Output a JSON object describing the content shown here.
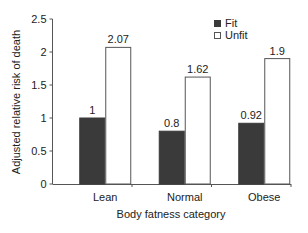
{
  "chart_data": {
    "type": "bar",
    "title": "",
    "xlabel": "Body fatness category",
    "ylabel": "Adjusted relative risk of death",
    "categories": [
      "Lean",
      "Normal",
      "Obese"
    ],
    "series": [
      {
        "name": "Fit",
        "values": [
          1,
          0.8,
          0.92
        ],
        "labels": [
          "1",
          "0.8",
          "0.92"
        ],
        "color": "#3a3a3a"
      },
      {
        "name": "Unfit",
        "values": [
          2.07,
          1.62,
          1.9
        ],
        "labels": [
          "2.07",
          "1.62",
          "1.9"
        ],
        "color": "#ffffff"
      }
    ],
    "ylim": [
      0,
      2.5
    ],
    "yticks": [
      0,
      0.5,
      1,
      1.5,
      2,
      2.5
    ],
    "ytick_labels": [
      "0",
      "0.5",
      "1",
      "1.5",
      "2",
      "2.5"
    ],
    "grid": false,
    "legend_position": "top-right"
  },
  "legend": {
    "fit": "Fit",
    "unfit": "Unfit"
  }
}
